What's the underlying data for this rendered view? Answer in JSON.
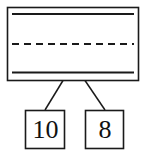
{
  "diagram": {
    "type": "tree-diagram",
    "stroke_color": "#1a1a1a",
    "background_color": "#ffffff",
    "root_node": {
      "name": "array-node",
      "shape": "rectangle",
      "label": "",
      "inner_lines": [
        {
          "name": "top-solid-line",
          "style": "solid"
        },
        {
          "name": "middle-dashed-line",
          "style": "dashed"
        },
        {
          "name": "bottom-solid-line",
          "style": "solid"
        }
      ]
    },
    "edges": [
      {
        "name": "edge-root-to-left",
        "from": "array-node",
        "to": "leaf-10"
      },
      {
        "name": "edge-root-to-right",
        "from": "array-node",
        "to": "leaf-8"
      }
    ],
    "leaves": [
      {
        "name": "leaf-10",
        "label": "10",
        "shape": "rectangle"
      },
      {
        "name": "leaf-8",
        "label": "8",
        "shape": "rectangle"
      }
    ]
  }
}
